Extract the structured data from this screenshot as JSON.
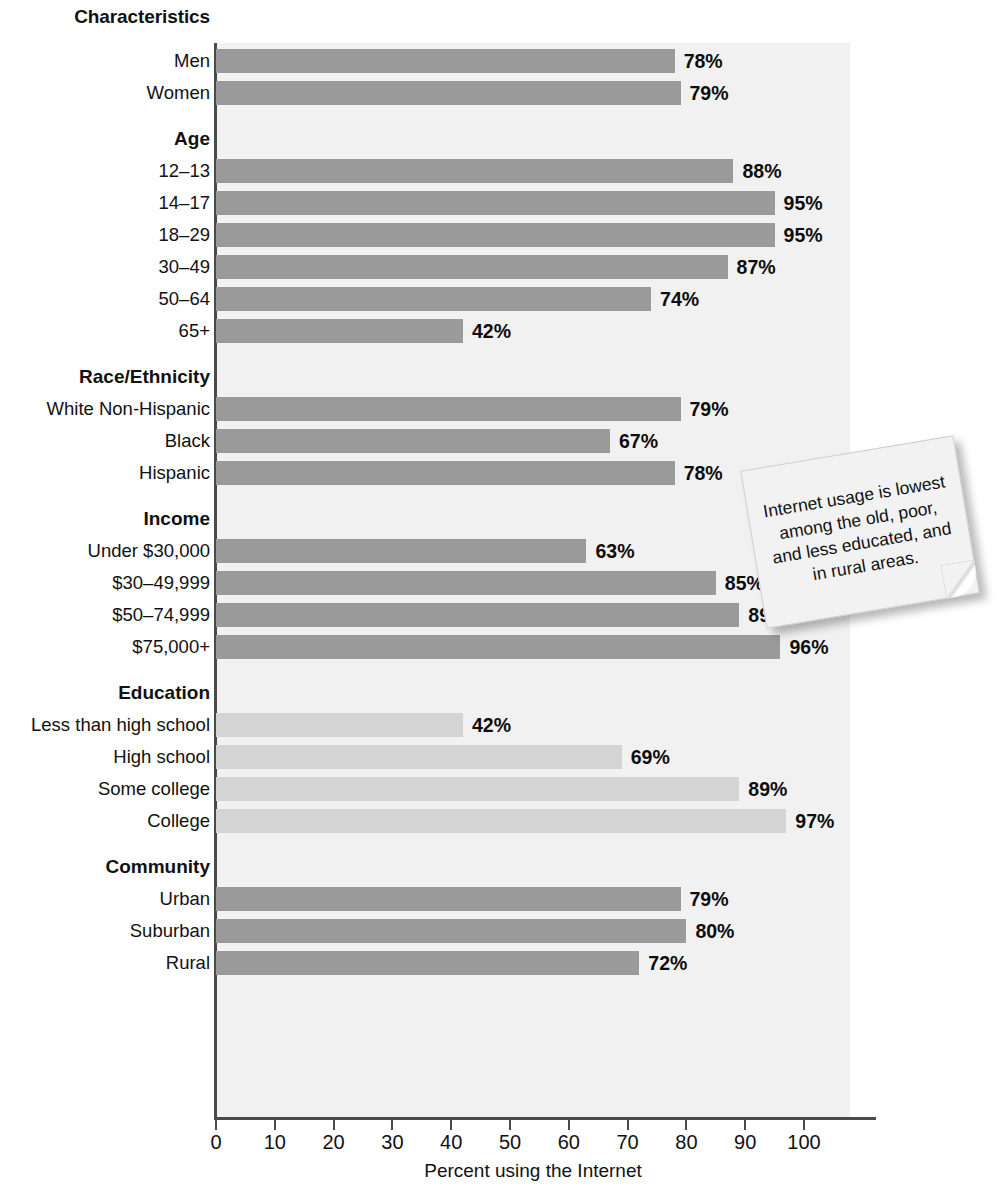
{
  "chart_data": {
    "type": "bar",
    "title": "Characteristics",
    "xlabel": "Percent using the Internet",
    "ylabel": "",
    "orientation": "horizontal",
    "xlim": [
      0,
      110
    ],
    "xticks": [
      0,
      10,
      20,
      30,
      40,
      50,
      60,
      70,
      80,
      90,
      100
    ],
    "xticklabels": [
      "0",
      "10",
      "20",
      "30",
      "40",
      "50",
      "60",
      "70",
      "80",
      "90",
      "100"
    ],
    "grid": false,
    "legend": "none",
    "value_suffix": "%",
    "colors": {
      "bar_dark": "#9a9a9a",
      "bar_light": "#d4d4d4",
      "panel": "#f1f1f1",
      "axis": "#4a4a4a"
    },
    "groups": [
      {
        "name": "",
        "is_header": false,
        "categories": [
          "Men",
          "Women"
        ],
        "values": [
          78,
          79
        ],
        "labels": [
          "78%",
          "79%"
        ],
        "shade": "dark"
      },
      {
        "name": "Age",
        "is_header": true,
        "categories": [
          "12–13",
          "14–17",
          "18–29",
          "30–49",
          "50–64",
          "65+"
        ],
        "values": [
          88,
          95,
          95,
          87,
          74,
          42
        ],
        "labels": [
          "88%",
          "95%",
          "95%",
          "87%",
          "74%",
          "42%"
        ],
        "shade": "dark"
      },
      {
        "name": "Race/Ethnicity",
        "is_header": true,
        "categories": [
          "White Non-Hispanic",
          "Black",
          "Hispanic"
        ],
        "values": [
          79,
          67,
          78
        ],
        "labels": [
          "79%",
          "67%",
          "78%"
        ],
        "shade": "dark"
      },
      {
        "name": "Income",
        "is_header": true,
        "categories": [
          "Under $30,000",
          "$30–49,999",
          "$50–74,999",
          "$75,000+"
        ],
        "values": [
          63,
          85,
          89,
          96
        ],
        "labels": [
          "63%",
          "85%",
          "89%",
          "96%"
        ],
        "shade": "dark"
      },
      {
        "name": "Education",
        "is_header": true,
        "categories": [
          "Less than high school",
          "High school",
          "Some college",
          "College"
        ],
        "values": [
          42,
          69,
          89,
          97
        ],
        "labels": [
          "42%",
          "69%",
          "89%",
          "97%"
        ],
        "shade": "light"
      },
      {
        "name": "Community",
        "is_header": true,
        "categories": [
          "Urban",
          "Suburban",
          "Rural"
        ],
        "values": [
          79,
          80,
          72
        ],
        "labels": [
          "79%",
          "80%",
          "72%"
        ],
        "shade": "dark"
      }
    ]
  },
  "annotation": {
    "text": "Internet usage is lowest among the old, poor, and less educated, and in rural areas."
  }
}
